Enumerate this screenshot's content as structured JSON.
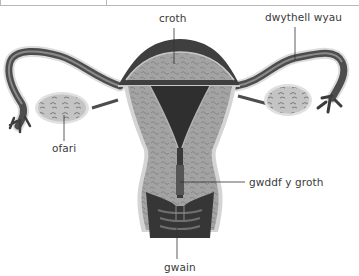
{
  "diagram": {
    "language": "Welsh",
    "colors": {
      "background": "#ffffff",
      "label_text": "#3a3a3a",
      "leader_line": "#333333",
      "tissue_light": "#a9a9a9",
      "tissue_dark": "#4a4a4a",
      "outline": "#d6d6d6"
    },
    "labels": {
      "uterus": "croth",
      "fallopian_tube": "dwythell wyau",
      "ovary": "ofari",
      "cervix": "gwddf y groth",
      "vagina": "gwain"
    }
  }
}
